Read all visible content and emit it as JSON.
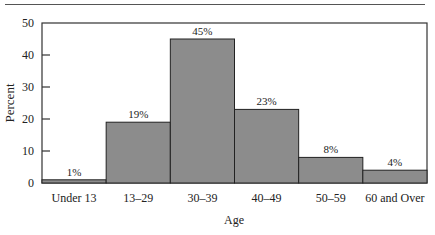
{
  "chart_data": {
    "type": "bar",
    "title": "",
    "xlabel": "Age",
    "ylabel": "Percent",
    "ylim": [
      0,
      50
    ],
    "yticks": [
      0,
      10,
      20,
      30,
      40,
      50
    ],
    "grid": false,
    "legend": null,
    "categories": [
      "Under 13",
      "13–29",
      "30–39",
      "40–49",
      "50–59",
      "60 and Over"
    ],
    "values": [
      1,
      19,
      45,
      23,
      8,
      4
    ],
    "data_labels": [
      "1%",
      "19%",
      "45%",
      "23%",
      "8%",
      "4%"
    ],
    "bar_color": "#8c8c8c"
  },
  "axis": {
    "ylabel": "Percent",
    "xlabel": "Age",
    "yticks": [
      "0",
      "10",
      "20",
      "30",
      "40",
      "50"
    ]
  },
  "bars": [
    {
      "label": "Under 13",
      "value_label": "1%"
    },
    {
      "label": "13–29",
      "value_label": "19%"
    },
    {
      "label": "30–39",
      "value_label": "45%"
    },
    {
      "label": "40–49",
      "value_label": "23%"
    },
    {
      "label": "50–59",
      "value_label": "8%"
    },
    {
      "label": "60 and Over",
      "value_label": "4%"
    }
  ]
}
